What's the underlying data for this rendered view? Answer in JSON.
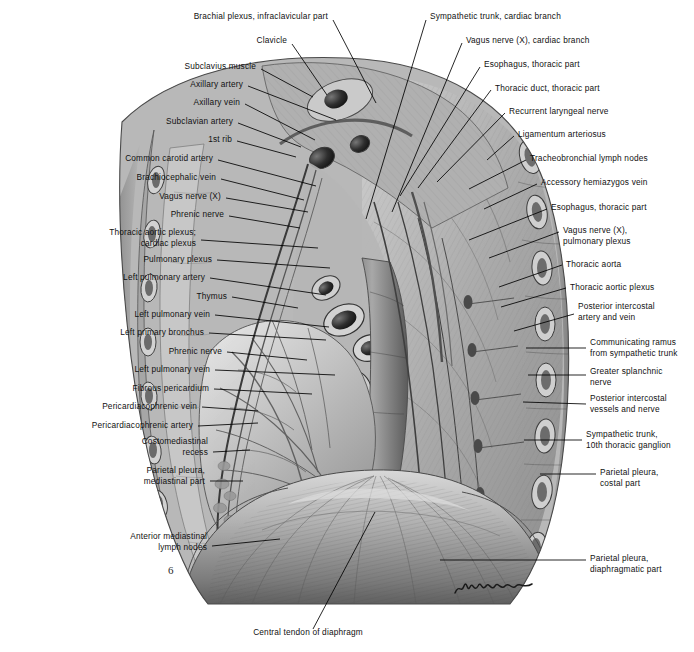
{
  "plate": {
    "title": "Thoracic cavity, left lateral mediastinal view",
    "background_color": "#ffffff",
    "ink_color": "#111111",
    "artist_signature": "signature"
  },
  "labels_left": [
    {
      "id": "brachial-plexus",
      "text": "Brachial plexus, infraclavicular part",
      "x": 328,
      "y": 16,
      "lx": 333,
      "ly": 20,
      "tx": 376,
      "ty": 103
    },
    {
      "id": "clavicle",
      "text": "Clavicle",
      "x": 287,
      "y": 40,
      "lx": 292,
      "ly": 44,
      "tx": 327,
      "ty": 95
    },
    {
      "id": "subclavius-muscle",
      "text": "Subclavius muscle",
      "x": 256,
      "y": 66,
      "lx": 261,
      "ly": 69,
      "tx": 313,
      "ty": 97
    },
    {
      "id": "axillary-artery",
      "text": "Axillary artery",
      "x": 243,
      "y": 84,
      "lx": 248,
      "ly": 86,
      "tx": 336,
      "ty": 120
    },
    {
      "id": "axillary-vein",
      "text": "Axillary vein",
      "x": 240,
      "y": 102,
      "lx": 245,
      "ly": 104,
      "tx": 315,
      "ty": 140
    },
    {
      "id": "subclavian-artery",
      "text": "Subclavian artery",
      "x": 233,
      "y": 121,
      "lx": 238,
      "ly": 123,
      "tx": 301,
      "ty": 147
    },
    {
      "id": "first-rib",
      "text": "1st rib",
      "x": 232,
      "y": 139,
      "lx": 237,
      "ly": 141,
      "tx": 296,
      "ty": 157
    },
    {
      "id": "common-carotid-artery",
      "text": "Common carotid artery",
      "x": 213,
      "y": 158,
      "lx": 218,
      "ly": 160,
      "tx": 316,
      "ty": 186
    },
    {
      "id": "brachiocephalic-vein",
      "text": "Brachiocephalic vein",
      "x": 216,
      "y": 177,
      "lx": 221,
      "ly": 179,
      "tx": 304,
      "ty": 200
    },
    {
      "id": "vagus-nerve-x",
      "text": "Vagus nerve (X)",
      "x": 221,
      "y": 196,
      "lx": 226,
      "ly": 198,
      "tx": 308,
      "ty": 212
    },
    {
      "id": "phrenic-nerve-upper",
      "text": "Phrenic nerve",
      "x": 224,
      "y": 214,
      "lx": 229,
      "ly": 216,
      "tx": 300,
      "ty": 228
    },
    {
      "id": "thoracic-aortic-cardiac-plexus",
      "text": "Thoracic aortic plexus;\ncardiac plexus",
      "x": 196,
      "y": 238,
      "lx": 201,
      "ly": 240,
      "tx": 318,
      "ty": 248
    },
    {
      "id": "pulmonary-plexus",
      "text": "Pulmonary plexus",
      "x": 212,
      "y": 259,
      "lx": 217,
      "ly": 260,
      "tx": 330,
      "ty": 268
    },
    {
      "id": "left-pulmonary-artery",
      "text": "Left pulmonary artery",
      "x": 205,
      "y": 277,
      "lx": 210,
      "ly": 278,
      "tx": 326,
      "ty": 295
    },
    {
      "id": "thymus",
      "text": "Thymus",
      "x": 227,
      "y": 296,
      "lx": 232,
      "ly": 297,
      "tx": 298,
      "ty": 308
    },
    {
      "id": "left-pulmonary-vein-upper",
      "text": "Left pulmonary vein",
      "x": 210,
      "y": 314,
      "lx": 215,
      "ly": 315,
      "tx": 329,
      "ty": 327
    },
    {
      "id": "left-primary-bronchus",
      "text": "Left primary bronchus",
      "x": 204,
      "y": 332,
      "lx": 209,
      "ly": 333,
      "tx": 326,
      "ty": 340
    },
    {
      "id": "phrenic-nerve-lower",
      "text": "Phrenic nerve",
      "x": 222,
      "y": 351,
      "lx": 227,
      "ly": 352,
      "tx": 307,
      "ty": 360
    },
    {
      "id": "left-pulmonary-vein-lower",
      "text": "Left pulmonary vein",
      "x": 210,
      "y": 369,
      "lx": 215,
      "ly": 370,
      "tx": 335,
      "ty": 375
    },
    {
      "id": "fibrous-pericardium",
      "text": "Fibrous pericardium",
      "x": 209,
      "y": 388,
      "lx": 214,
      "ly": 389,
      "tx": 312,
      "ty": 394
    },
    {
      "id": "pericardiacophrenic-vein",
      "text": "Pericardiacophrenic vein",
      "x": 197,
      "y": 406,
      "lx": 202,
      "ly": 407,
      "tx": 258,
      "ty": 411
    },
    {
      "id": "pericardiacophrenic-artery",
      "text": "Pericardiacophrenic artery",
      "x": 193,
      "y": 425,
      "lx": 198,
      "ly": 426,
      "tx": 258,
      "ty": 423
    },
    {
      "id": "costomediastinal-recess",
      "text": "Costomediastinal\nrecess",
      "x": 208,
      "y": 447,
      "lx": 213,
      "ly": 452,
      "tx": 250,
      "ty": 450
    },
    {
      "id": "parietal-pleura-mediastinal",
      "text": "Parietal pleura,\nmediastinal part",
      "x": 205,
      "y": 476,
      "lx": 210,
      "ly": 481,
      "tx": 243,
      "ty": 481
    },
    {
      "id": "anterior-mediastinal-lymph-nodes",
      "text": "Anterior mediastinal\nlymph nodes",
      "x": 207,
      "y": 542,
      "lx": 212,
      "ly": 546,
      "tx": 280,
      "ty": 539
    },
    {
      "id": "central-tendon-of-diaphragm",
      "text": "Central tendon of diaphragm",
      "x": 308,
      "y": 632,
      "lx": 313,
      "ly": 629,
      "tx": 375,
      "ty": 512
    }
  ],
  "labels_right": [
    {
      "id": "sympathetic-trunk-cardiac-branch",
      "text": "Sympathetic trunk, cardiac branch",
      "x": 430,
      "y": 16,
      "lx": 426,
      "ly": 20,
      "tx": 366,
      "ty": 219
    },
    {
      "id": "vagus-nerve-cardiac-branch",
      "text": "Vagus nerve (X), cardiac branch",
      "x": 466,
      "y": 40,
      "lx": 462,
      "ly": 43,
      "tx": 392,
      "ty": 212
    },
    {
      "id": "esophagus-thoracic-part-upper",
      "text": "Esophagus, thoracic part",
      "x": 484,
      "y": 64,
      "lx": 480,
      "ly": 67,
      "tx": 400,
      "ty": 196
    },
    {
      "id": "thoracic-duct-thoracic-part",
      "text": "Thoracic duct, thoracic part",
      "x": 495,
      "y": 88,
      "lx": 491,
      "ly": 90,
      "tx": 418,
      "ty": 188
    },
    {
      "id": "recurrent-laryngeal-nerve",
      "text": "Recurrent laryngeal nerve",
      "x": 509,
      "y": 111,
      "lx": 505,
      "ly": 113,
      "tx": 437,
      "ty": 182
    },
    {
      "id": "ligamentum-arteriosum",
      "text": "Ligamentum arteriosus",
      "x": 518,
      "y": 134,
      "lx": 514,
      "ly": 136,
      "tx": 487,
      "ty": 160
    },
    {
      "id": "tracheobronchial-lymph-nodes",
      "text": "Tracheobronchial lymph nodes",
      "x": 530,
      "y": 158,
      "lx": 526,
      "ly": 160,
      "tx": 469,
      "ty": 189
    },
    {
      "id": "accessory-hemiazygos-vein",
      "text": "Accessory hemiazygos vein",
      "x": 541,
      "y": 182,
      "lx": 537,
      "ly": 184,
      "tx": 484,
      "ty": 209
    },
    {
      "id": "esophagus-thoracic-part-lower",
      "text": "Esophagus, thoracic part",
      "x": 551,
      "y": 207,
      "lx": 547,
      "ly": 209,
      "tx": 469,
      "ty": 240
    },
    {
      "id": "vagus-nerve-pulmonary-plexus",
      "text": "Vagus nerve (X),\npulmonary plexus",
      "x": 563,
      "y": 236,
      "lx": 559,
      "ly": 232,
      "tx": 489,
      "ty": 258
    },
    {
      "id": "thoracic-aorta",
      "text": "Thoracic aorta",
      "x": 566,
      "y": 264,
      "lx": 562,
      "ly": 265,
      "tx": 499,
      "ty": 287
    },
    {
      "id": "thoracic-aortic-plexus",
      "text": "Thoracic aortic plexus",
      "x": 570,
      "y": 287,
      "lx": 566,
      "ly": 288,
      "tx": 501,
      "ty": 307
    },
    {
      "id": "posterior-intercostal-artery-vein",
      "text": "Posterior intercostal\nartery and vein",
      "x": 578,
      "y": 312,
      "lx": 574,
      "ly": 314,
      "tx": 514,
      "ty": 331
    },
    {
      "id": "communicating-ramus",
      "text": "Communicating ramus\nfrom sympathetic trunk",
      "x": 590,
      "y": 348,
      "lx": 586,
      "ly": 348,
      "tx": 526,
      "ty": 348
    },
    {
      "id": "greater-splanchnic-nerve",
      "text": "Greater splanchnic\nnerve",
      "x": 590,
      "y": 377,
      "lx": 586,
      "ly": 375,
      "tx": 528,
      "ty": 375
    },
    {
      "id": "posterior-intercostal-vessels-nerve",
      "text": "Posterior intercostal\nvessels and nerve",
      "x": 590,
      "y": 404,
      "lx": 586,
      "ly": 404,
      "tx": 523,
      "ty": 402
    },
    {
      "id": "sympathetic-trunk-10th-ganglion",
      "text": "Sympathetic trunk,\n10th thoracic ganglion",
      "x": 586,
      "y": 440,
      "lx": 582,
      "ly": 440,
      "tx": 524,
      "ty": 440
    },
    {
      "id": "parietal-pleura-costal",
      "text": "Parietal pleura,\ncostal part",
      "x": 600,
      "y": 478,
      "lx": 596,
      "ly": 474,
      "tx": 540,
      "ty": 474
    },
    {
      "id": "parietal-pleura-diaphragmatic",
      "text": "Parietal pleura,\ndiaphragmatic part",
      "x": 590,
      "y": 564,
      "lx": 586,
      "ly": 560,
      "tx": 440,
      "ty": 560
    }
  ]
}
